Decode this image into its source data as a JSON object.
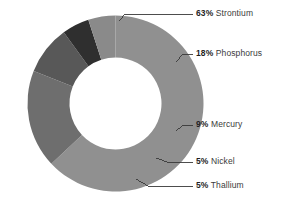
{
  "chart_data": {
    "type": "pie",
    "variant": "donut",
    "title": "",
    "subtitle": "",
    "xlabel": "",
    "ylabel": "",
    "grid": false,
    "legend_position": "right-callouts",
    "value_unit": "%",
    "total": 100,
    "categories": [
      "Strontium",
      "Phosphorus",
      "Mercury",
      "Nickel",
      "Thallium"
    ],
    "values": [
      63,
      18,
      9,
      5,
      5
    ],
    "colors": [
      "#909090",
      "#6e6e6e",
      "#585858",
      "#2f2f2f",
      "#8a8a8a"
    ],
    "slices": [
      {
        "label": "Strontium",
        "value": 63,
        "value_text": "63",
        "unit": "%",
        "color": "#909090",
        "start_angle": 0,
        "end_angle": 226.8
      },
      {
        "label": "Phosphorus",
        "value": 18,
        "value_text": "18",
        "unit": "%",
        "color": "#6e6e6e",
        "start_angle": 226.8,
        "end_angle": 291.6
      },
      {
        "label": "Mercury",
        "value": 9,
        "value_text": "9",
        "unit": "%",
        "color": "#585858",
        "start_angle": 291.6,
        "end_angle": 324.0
      },
      {
        "label": "Nickel",
        "value": 5,
        "value_text": "5",
        "unit": "%",
        "color": "#2f2f2f",
        "start_angle": 324.0,
        "end_angle": 342.0
      },
      {
        "label": "Thallium",
        "value": 5,
        "value_text": "5",
        "unit": "%",
        "color": "#8a8a8a",
        "start_angle": 342.0,
        "end_angle": 360.0
      }
    ]
  },
  "callouts": [
    {
      "pct": "63",
      "sym": "%",
      "name": "Strontium"
    },
    {
      "pct": "18",
      "sym": "%",
      "name": "Phosphorus"
    },
    {
      "pct": "9",
      "sym": "%",
      "name": "Mercury"
    },
    {
      "pct": "5",
      "sym": "%",
      "name": "Nickel"
    },
    {
      "pct": "5",
      "sym": "%",
      "name": "Thallium"
    }
  ],
  "style": {
    "background": "#ffffff",
    "leader_line_color": "#3a3a3a",
    "hole_color": "#ffffff",
    "text_color": "#2e2e2e"
  }
}
